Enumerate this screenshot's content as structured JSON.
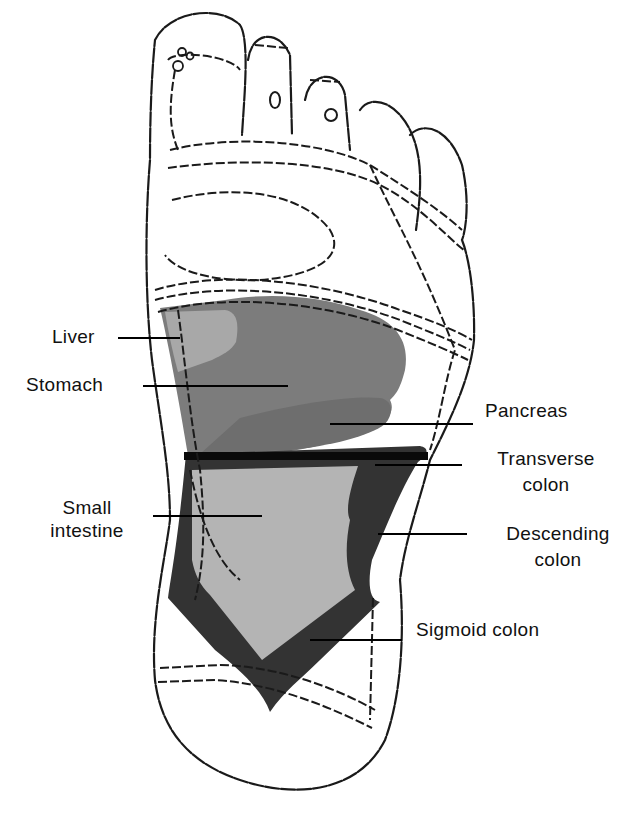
{
  "colors": {
    "background": "#ffffff",
    "outline": "#1a1a1a",
    "liver": "#a8a8a8",
    "stomach": "#7c7c7c",
    "pancreas": "#6e6e6e",
    "small_intestine": "#b4b4b4",
    "colon": "#333333",
    "transverse_band": "#0a0a0a"
  },
  "labels": {
    "liver": "Liver",
    "stomach": "Stomach",
    "pancreas": "Pancreas",
    "transverse_colon_line1": "Transverse",
    "transverse_colon_line2": "colon",
    "small_intestine_line1": "Small",
    "small_intestine_line2": "intestine",
    "descending_colon_line1": "Descending",
    "descending_colon_line2": "colon",
    "sigmoid_colon": "Sigmoid colon"
  },
  "regions": [
    {
      "id": "liver",
      "side": "left"
    },
    {
      "id": "stomach",
      "side": "left"
    },
    {
      "id": "small_intestine",
      "side": "left"
    },
    {
      "id": "pancreas",
      "side": "right"
    },
    {
      "id": "transverse_colon",
      "side": "right"
    },
    {
      "id": "descending_colon",
      "side": "right"
    },
    {
      "id": "sigmoid_colon",
      "side": "right"
    }
  ]
}
